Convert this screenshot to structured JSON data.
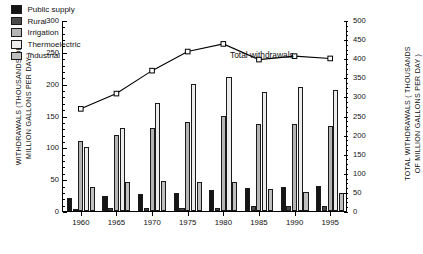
{
  "chart_data": {
    "type": "bar",
    "title": "",
    "subtitle": "",
    "categories": [
      "1960",
      "1965",
      "1970",
      "1975",
      "1980",
      "1985",
      "1990",
      "1995"
    ],
    "xlabel": "",
    "ylabel": "WITHDRAWALS  (THOUSANDS OF\nMILLION GALLONS PER DAY )",
    "ylabel_right": "TOTAL WITHDRAWALS ( THOUSANDS\nOF MILLION GALLONS PER DAY )",
    "ylim": [
      0,
      300
    ],
    "ylim_right": [
      0,
      500
    ],
    "yticks": [
      0,
      50,
      100,
      150,
      200,
      250,
      300
    ],
    "yticks_right": [
      0,
      50,
      100,
      150,
      200,
      250,
      300,
      350,
      400,
      450,
      500
    ],
    "grid": false,
    "legend_position": "top-left",
    "series": [
      {
        "name": "Public supply",
        "axis": "left",
        "kind": "bar",
        "color": "#151515",
        "values": [
          21,
          24,
          27,
          29,
          33,
          36.5,
          38.5,
          40
        ]
      },
      {
        "name": "Rural",
        "axis": "left",
        "kind": "bar",
        "color": "#4a4a4a",
        "values": [
          3.6,
          4,
          4.5,
          4.5,
          5.5,
          7.5,
          8,
          8.5
        ]
      },
      {
        "name": "Irrigation",
        "axis": "left",
        "kind": "bar",
        "color": "#b4b4b4",
        "values": [
          110,
          120,
          130,
          140,
          150,
          137,
          137,
          134
        ]
      },
      {
        "name": "Thermoelectric",
        "axis": "left",
        "kind": "bar",
        "color": "#ececec",
        "values": [
          100,
          130,
          170,
          200,
          210,
          187,
          195,
          190
        ]
      },
      {
        "name": "Industrial",
        "axis": "left",
        "kind": "bar",
        "color": "#bfbfbf",
        "values": [
          38,
          46,
          47,
          45,
          45,
          35,
          30,
          29
        ]
      },
      {
        "name": "Total withdrawals",
        "axis": "right",
        "kind": "line",
        "color": "#000000",
        "values": [
          270,
          310,
          370,
          420,
          440,
          399,
          408,
          402
        ]
      }
    ],
    "annotations": [
      {
        "text": "Total withdrawals",
        "x": 1985,
        "note": "line series label above the curve"
      }
    ]
  },
  "legend": {
    "items": [
      {
        "label": "Public supply",
        "swatch": "public-supply-swatch"
      },
      {
        "label": "Rural",
        "swatch": "rural-swatch"
      },
      {
        "label": "Irrigation",
        "swatch": "irrigation-swatch"
      },
      {
        "label": "Thermoelectric",
        "swatch": "thermoelectric-swatch"
      },
      {
        "label": "Industrial",
        "swatch": "industrial-swatch"
      }
    ]
  }
}
